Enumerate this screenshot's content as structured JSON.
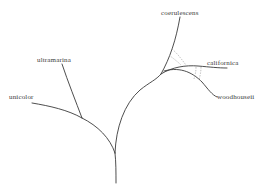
{
  "diagram": {
    "type": "phylogenetic-tree",
    "taxa": [
      {
        "id": "coerulescens",
        "label": "coerulescens"
      },
      {
        "id": "ultramarina",
        "label": "ultramarina"
      },
      {
        "id": "unicolor",
        "label": "unicolor"
      },
      {
        "id": "californica",
        "label": "californica"
      },
      {
        "id": "woodhouseii",
        "label": "woodhouseii"
      }
    ],
    "gene_flow": [
      {
        "between": [
          "coerulescens",
          "californica"
        ],
        "style": "dashed"
      },
      {
        "between": [
          "californica",
          "woodhouseii"
        ],
        "style": "dashed"
      }
    ],
    "colors": {
      "branch": "#3a3a3a",
      "gene_flow": "#9a9a9a",
      "background": "#ffffff"
    }
  }
}
